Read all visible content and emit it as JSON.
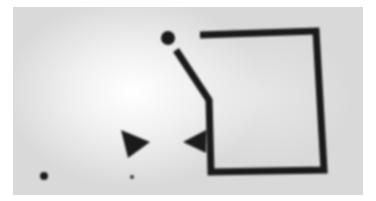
{
  "image": {
    "description": "Blurry grayscale photo of a hand-drawn diagram on paper",
    "background_color": "#d8d8d8",
    "ink_color": "#1a1a1a"
  },
  "shapes": {
    "top_dot": {
      "cx": 168,
      "cy": 38,
      "r": 7
    },
    "path_points": "200,35 316,31 324,170 211,172 209,100 176,50",
    "left_triangle": "121,130 150,142 128,158",
    "right_triangle": "183,142 206,130 206,153",
    "small_dot_left": {
      "cx": 44,
      "cy": 176,
      "r": 4
    },
    "small_dot_mid": {
      "cx": 132,
      "cy": 177,
      "r": 2
    }
  }
}
